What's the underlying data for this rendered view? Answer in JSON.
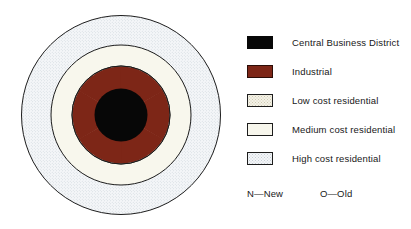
{
  "figure": {
    "diagram": {
      "center_label": "Central Business District",
      "zones": [
        {
          "name": "central-business-district",
          "label": "Central Business District",
          "color": "#070707",
          "radius_px": 26
        },
        {
          "name": "industrial-ring",
          "label": "Industrial",
          "color": "#7d2617",
          "radius_px": 49
        },
        {
          "name": "low-cost-residential-ring",
          "label": "Low cost residential",
          "color": "#f4f2e7",
          "radius_px": 49
        },
        {
          "name": "medium-cost-residential-ring",
          "label": "Medium cost residential",
          "color": "#f7f6ec",
          "radius_px": 70
        },
        {
          "name": "high-cost-residential-ring",
          "label": "High cost residential",
          "color": "#f4f6f8",
          "radius_px": 100
        }
      ],
      "industrial_wedge_count": 6,
      "industrial_wedge_span_deg": 26,
      "outline_color": "#1d1d1d"
    }
  },
  "legend": {
    "items": [
      {
        "key": "cbd",
        "label": "Central Business District",
        "color": "#070707",
        "pattern": "solid"
      },
      {
        "key": "ind",
        "label": "Industrial",
        "color": "#7d2617",
        "pattern": "solid"
      },
      {
        "key": "low",
        "label": "Low cost  residential",
        "color": "#f4f2e7",
        "pattern": "stipple"
      },
      {
        "key": "med",
        "label": "Medium cost residential",
        "color": "#f7f6ec",
        "pattern": "plain"
      },
      {
        "key": "high",
        "label": "High cost residential",
        "color": "#f4f6f8",
        "pattern": "stipple"
      }
    ]
  },
  "notes": {
    "new": "N—New",
    "old": "O—Old"
  },
  "colors": {
    "cbd": "#070707",
    "industrial": "#7d2617",
    "low_cost": "#f4f2e7",
    "medium_cost": "#f7f6ec",
    "high_cost": "#f4f6f8",
    "outline": "#1d1d1d",
    "text": "#181818",
    "background": "#ffffff"
  }
}
